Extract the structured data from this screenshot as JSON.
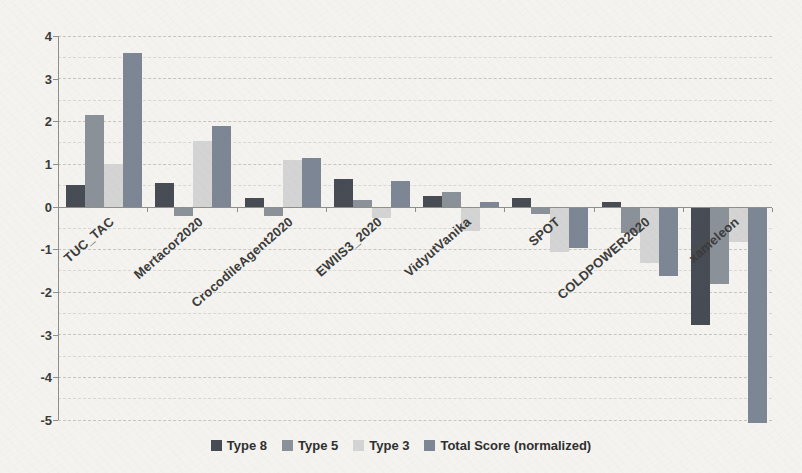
{
  "chart_data": {
    "type": "bar",
    "title": "",
    "xlabel": "",
    "ylabel": "",
    "ylim": [
      -5,
      4
    ],
    "grid": "horizontal-dashed, minor every 0.5",
    "legend_position": "bottom-center",
    "y_tick_labels": [
      "4",
      "3",
      "2",
      "1",
      "0",
      "-1",
      "-2",
      "-3",
      "-4",
      "-5"
    ],
    "categories": [
      "TUC_TAC",
      "Mertacor2020",
      "CrocodileAgent2020",
      "EWIIS3_2020",
      "VidyutVanika",
      "SPOT",
      "COLDPOWER2020",
      "xameleon"
    ],
    "series": [
      {
        "name": "Type 8",
        "color": "#474b53",
        "values": [
          0.5,
          0.55,
          0.2,
          0.65,
          0.25,
          0.2,
          0.1,
          -2.75
        ]
      },
      {
        "name": "Type 5",
        "color": "#8b9199",
        "values": [
          2.15,
          -0.2,
          -0.2,
          0.15,
          0.35,
          -0.15,
          -0.6,
          -1.8
        ]
      },
      {
        "name": "Type 3",
        "color": "#d3d4d3",
        "values": [
          1.0,
          1.55,
          1.1,
          -0.25,
          -0.55,
          -1.05,
          -1.3,
          -0.8
        ]
      },
      {
        "name": "Total Score (normalized)",
        "color": "#7d8694",
        "values": [
          3.6,
          1.9,
          1.15,
          0.6,
          0.1,
          -0.95,
          -1.6,
          -5.05
        ]
      }
    ],
    "colors": {
      "background": "#f4f3ef",
      "axis": "#8f8f8b",
      "gridline": "#d9d8d3",
      "text": "#3a3a3a"
    }
  }
}
